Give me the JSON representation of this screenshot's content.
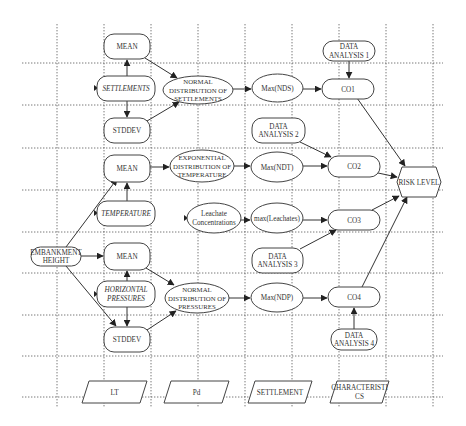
{
  "diagram": {
    "type": "flowchart",
    "grid": {
      "columns_x": [
        57,
        104,
        151,
        198,
        245,
        292,
        339,
        386,
        433
      ],
      "rows_y": [
        63,
        105,
        148,
        190,
        232,
        273,
        315,
        356,
        397
      ],
      "x_range": [
        22,
        443
      ],
      "y_range": [
        24,
        407
      ]
    },
    "nodes": [
      {
        "id": "mean1",
        "shape": "rounded",
        "x": 104,
        "y": 34,
        "w": 46,
        "h": 25,
        "lines": [
          "MEAN"
        ]
      },
      {
        "id": "settlements",
        "shape": "rounded",
        "italic": true,
        "x": 97,
        "y": 76,
        "w": 58,
        "h": 25,
        "lines": [
          "SETTLEMENTS"
        ]
      },
      {
        "id": "stddev1",
        "shape": "rounded",
        "x": 104,
        "y": 118,
        "w": 46,
        "h": 25,
        "lines": [
          "STDDEV"
        ]
      },
      {
        "id": "nds",
        "shape": "ellipse",
        "x": 163,
        "y": 76,
        "w": 70,
        "h": 28,
        "lines": [
          "NORMAL",
          "DISTRIBUTION OF",
          "SETTLEMENTS"
        ]
      },
      {
        "id": "maxnds",
        "shape": "ellipse",
        "x": 252,
        "y": 74,
        "w": 51,
        "h": 28,
        "lines": [
          "Max(NDS)"
        ]
      },
      {
        "id": "da1",
        "shape": "rounded",
        "x": 323,
        "y": 41,
        "w": 52,
        "h": 20,
        "lines": [
          "DATA",
          "ANALYSIS 1"
        ]
      },
      {
        "id": "co1",
        "shape": "rounded",
        "x": 322,
        "y": 79,
        "w": 52,
        "h": 20,
        "lines": [
          "CO1"
        ]
      },
      {
        "id": "da2",
        "shape": "rounded",
        "x": 252,
        "y": 118,
        "w": 53,
        "h": 25,
        "lines": [
          "DATA",
          "ANALYSIS 2"
        ]
      },
      {
        "id": "mean2",
        "shape": "rounded",
        "x": 104,
        "y": 155,
        "w": 46,
        "h": 27,
        "lines": [
          "MEAN"
        ]
      },
      {
        "id": "ndt",
        "shape": "ellipse",
        "x": 170,
        "y": 150,
        "w": 64,
        "h": 32,
        "lines": [
          "EXPONENTIAL",
          "DISTRIBUTION OF",
          "TEMPERATURE"
        ]
      },
      {
        "id": "maxndt",
        "shape": "ellipse",
        "x": 251,
        "y": 152,
        "w": 52,
        "h": 30,
        "lines": [
          "Max(NDT)"
        ]
      },
      {
        "id": "co2",
        "shape": "rounded",
        "x": 328,
        "y": 156,
        "w": 52,
        "h": 21,
        "lines": [
          "CO2"
        ]
      },
      {
        "id": "risk",
        "shape": "hexagon",
        "x": 397,
        "y": 167,
        "w": 44,
        "h": 30,
        "lines": [
          "RISK LEVEL"
        ]
      },
      {
        "id": "temperature",
        "shape": "rounded",
        "italic": true,
        "x": 97,
        "y": 201,
        "w": 58,
        "h": 25,
        "lines": [
          "TEMPERATURE"
        ]
      },
      {
        "id": "leachate",
        "shape": "ellipse",
        "x": 187,
        "y": 203,
        "w": 54,
        "h": 30,
        "lines": [
          "Leachate",
          "Concentrations"
        ],
        "mixed_case": true
      },
      {
        "id": "maxleach",
        "shape": "ellipse",
        "x": 251,
        "y": 203,
        "w": 52,
        "h": 30,
        "lines": [
          "max(Leachates)"
        ]
      },
      {
        "id": "co3",
        "shape": "rounded",
        "x": 328,
        "y": 210,
        "w": 52,
        "h": 20,
        "lines": [
          "CO3"
        ]
      },
      {
        "id": "embankment",
        "shape": "rounded",
        "x": 31,
        "y": 247,
        "w": 50,
        "h": 19,
        "lines": [
          "EMBANKMENT",
          "HEIGHT"
        ]
      },
      {
        "id": "mean3",
        "shape": "rounded",
        "x": 104,
        "y": 243,
        "w": 46,
        "h": 27,
        "lines": [
          "MEAN"
        ]
      },
      {
        "id": "da3",
        "shape": "rounded",
        "x": 252,
        "y": 248,
        "w": 51,
        "h": 25,
        "lines": [
          "DATA",
          "ANALYSIS 3"
        ]
      },
      {
        "id": "horizontal",
        "shape": "rounded",
        "italic": true,
        "x": 97,
        "y": 281,
        "w": 58,
        "h": 26,
        "lines": [
          "HORIZONTAL",
          "PRESSURES"
        ]
      },
      {
        "id": "ndp",
        "shape": "ellipse",
        "x": 165,
        "y": 283,
        "w": 64,
        "h": 30,
        "lines": [
          "NORMAL",
          "DISTRIBUTION OF",
          "PRESSURES"
        ]
      },
      {
        "id": "maxndp",
        "shape": "ellipse",
        "x": 251,
        "y": 283,
        "w": 52,
        "h": 29,
        "lines": [
          "Max(NDP)"
        ]
      },
      {
        "id": "co4",
        "shape": "rounded",
        "x": 328,
        "y": 287,
        "w": 52,
        "h": 20,
        "lines": [
          "CO4"
        ]
      },
      {
        "id": "stddev2",
        "shape": "rounded",
        "x": 104,
        "y": 327,
        "w": 46,
        "h": 25,
        "lines": [
          "STDDEV"
        ]
      },
      {
        "id": "da4",
        "shape": "rounded",
        "x": 331,
        "y": 329,
        "w": 46,
        "h": 21,
        "lines": [
          "DATA",
          "ANALYSIS 4"
        ]
      }
    ],
    "legend": [
      {
        "id": "lt",
        "x": 82,
        "y": 381,
        "w": 65,
        "h": 22,
        "lines": [
          "LT"
        ]
      },
      {
        "id": "pd",
        "x": 164,
        "y": 381,
        "w": 65,
        "h": 22,
        "lines": [
          "Pd"
        ]
      },
      {
        "id": "settlement",
        "x": 248,
        "y": 381,
        "w": 64,
        "h": 22,
        "lines": [
          "SETTLEMENT"
        ]
      },
      {
        "id": "characteristics",
        "x": 330,
        "y": 381,
        "w": 59,
        "h": 22,
        "lines": [
          "CHARACTERISTI",
          "CS"
        ]
      }
    ],
    "edges": [
      {
        "from": "settlements",
        "to": "mean1",
        "points": [
          [
            127,
            76
          ],
          [
            127,
            60
          ]
        ]
      },
      {
        "from": "settlements",
        "to": "stddev1",
        "points": [
          [
            127,
            101
          ],
          [
            127,
            117
          ]
        ]
      },
      {
        "from": "mean1",
        "to": "nds",
        "points": [
          [
            145,
            58
          ],
          [
            177,
            78
          ]
        ]
      },
      {
        "from": "stddev1",
        "to": "nds",
        "points": [
          [
            147,
            121
          ],
          [
            179,
            102
          ]
        ]
      },
      {
        "from": "nds",
        "to": "maxnds",
        "points": [
          [
            233,
            89
          ],
          [
            251,
            89
          ]
        ]
      },
      {
        "from": "maxnds",
        "to": "co1",
        "points": [
          [
            303,
            89
          ],
          [
            321,
            89
          ]
        ]
      },
      {
        "from": "da1",
        "to": "co1",
        "points": [
          [
            349,
            61
          ],
          [
            349,
            78
          ]
        ]
      },
      {
        "from": "co1",
        "to": "risk",
        "points": [
          [
            357,
            98
          ],
          [
            405,
            166
          ]
        ]
      },
      {
        "from": "da2",
        "to": "co2",
        "points": [
          [
            300,
            142
          ],
          [
            331,
            157
          ]
        ]
      },
      {
        "from": "temperature",
        "to": "mean2",
        "points": [
          [
            127,
            201
          ],
          [
            127,
            183
          ]
        ]
      },
      {
        "from": "embankment",
        "to": "mean2",
        "points": [
          [
            66,
            247
          ],
          [
            117,
            179
          ]
        ]
      },
      {
        "from": "mean2",
        "to": "ndt",
        "points": [
          [
            150,
            167
          ],
          [
            169,
            167
          ]
        ]
      },
      {
        "from": "ndt",
        "to": "maxndt",
        "points": [
          [
            234,
            166
          ],
          [
            250,
            166
          ]
        ]
      },
      {
        "from": "maxndt",
        "to": "co2",
        "points": [
          [
            303,
            166
          ],
          [
            327,
            166
          ]
        ]
      },
      {
        "from": "co2",
        "to": "risk",
        "points": [
          [
            378,
            173
          ],
          [
            397,
            177
          ]
        ]
      },
      {
        "from": "leachate",
        "to": "maxleach",
        "points": [
          [
            241,
            220
          ],
          [
            250,
            220
          ]
        ]
      },
      {
        "from": "maxleach",
        "to": "co3",
        "points": [
          [
            303,
            220
          ],
          [
            327,
            220
          ]
        ]
      },
      {
        "from": "co3",
        "to": "risk",
        "points": [
          [
            372,
            210
          ],
          [
            399,
            196
          ]
        ]
      },
      {
        "from": "da3",
        "to": "co3",
        "points": [
          [
            300,
            249
          ],
          [
            336,
            230
          ]
        ]
      },
      {
        "from": "embankment",
        "to": "mean3",
        "points": [
          [
            81,
            256
          ],
          [
            103,
            256
          ]
        ]
      },
      {
        "from": "embankment",
        "to": "stddev2",
        "points": [
          [
            66,
            266
          ],
          [
            116,
            326
          ]
        ]
      },
      {
        "from": "horizontal",
        "to": "mean3",
        "points": [
          [
            127,
            281
          ],
          [
            127,
            271
          ]
        ]
      },
      {
        "from": "horizontal",
        "to": "stddev2",
        "points": [
          [
            127,
            307
          ],
          [
            127,
            326
          ]
        ]
      },
      {
        "from": "mean3",
        "to": "ndp",
        "points": [
          [
            146,
            268
          ],
          [
            174,
            285
          ]
        ]
      },
      {
        "from": "stddev2",
        "to": "ndp",
        "points": [
          [
            147,
            330
          ],
          [
            176,
            311
          ]
        ]
      },
      {
        "from": "ndp",
        "to": "maxndp",
        "points": [
          [
            229,
            298
          ],
          [
            250,
            298
          ]
        ]
      },
      {
        "from": "maxndp",
        "to": "co4",
        "points": [
          [
            303,
            298
          ],
          [
            327,
            298
          ]
        ]
      },
      {
        "from": "da4",
        "to": "co4",
        "points": [
          [
            354,
            329
          ],
          [
            354,
            308
          ]
        ]
      },
      {
        "from": "co4",
        "to": "risk",
        "points": [
          [
            362,
            287
          ],
          [
            407,
            197
          ]
        ]
      }
    ],
    "entry_markers": [
      {
        "node": "settlements",
        "x": 97,
        "y": 88
      },
      {
        "node": "temperature",
        "x": 97,
        "y": 213
      },
      {
        "node": "horizontal",
        "x": 97,
        "y": 294
      },
      {
        "node": "leachate",
        "x": 187,
        "y": 218
      }
    ]
  }
}
